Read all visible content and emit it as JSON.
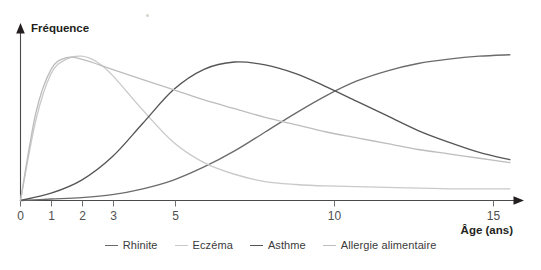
{
  "chart_data": {
    "type": "line",
    "title": "",
    "xlabel": "Âge (ans)",
    "ylabel": "Fréquence",
    "grid": false,
    "legend_position": "bottom-center",
    "xlim": [
      0,
      16.2
    ],
    "ylim": [
      0,
      1.06
    ],
    "xticks": [
      0,
      1,
      2,
      3,
      5,
      10,
      15
    ],
    "xtick_labels": [
      "0",
      "1",
      "2",
      "3",
      "5",
      "10",
      "15"
    ],
    "yticks": [],
    "ytick_labels": [],
    "series": [
      {
        "name": "Rhinite",
        "color": "#6b6b6b",
        "x": [
          0,
          1,
          2,
          3,
          4,
          5,
          6,
          7,
          8,
          9,
          10,
          11,
          12,
          13,
          14,
          15,
          16
        ],
        "values": [
          0.0,
          0.01,
          0.02,
          0.04,
          0.08,
          0.14,
          0.23,
          0.34,
          0.47,
          0.6,
          0.72,
          0.82,
          0.89,
          0.94,
          0.97,
          0.99,
          1.0
        ]
      },
      {
        "name": "Eczéma",
        "color": "#c9c9c9",
        "x": [
          0,
          0.5,
          1,
          1.5,
          2,
          2.5,
          3,
          4,
          5,
          6,
          7,
          8,
          9,
          10,
          12,
          14,
          16
        ],
        "values": [
          0.0,
          0.55,
          0.87,
          0.97,
          0.99,
          0.95,
          0.86,
          0.62,
          0.4,
          0.26,
          0.18,
          0.13,
          0.11,
          0.1,
          0.09,
          0.08,
          0.08
        ]
      },
      {
        "name": "Asthme",
        "color": "#555555",
        "x": [
          0,
          1,
          2,
          3,
          4,
          5,
          6,
          7,
          8,
          9,
          10,
          11,
          12,
          13,
          14,
          15,
          16
        ],
        "values": [
          0.0,
          0.05,
          0.14,
          0.3,
          0.53,
          0.76,
          0.9,
          0.95,
          0.93,
          0.87,
          0.78,
          0.68,
          0.58,
          0.48,
          0.4,
          0.33,
          0.28
        ]
      },
      {
        "name": "Allergie alimentaire",
        "color": "#bdbdbd",
        "x": [
          0,
          0.5,
          1,
          1.5,
          2,
          3,
          4,
          5,
          6,
          7,
          8,
          9,
          10,
          11,
          12,
          13,
          14,
          15,
          16
        ],
        "values": [
          0.0,
          0.6,
          0.9,
          0.98,
          0.97,
          0.9,
          0.83,
          0.76,
          0.69,
          0.63,
          0.57,
          0.52,
          0.47,
          0.43,
          0.39,
          0.35,
          0.32,
          0.29,
          0.26
        ]
      }
    ]
  },
  "axes": {
    "y_label": "Fréquence",
    "x_label": "Âge (ans)",
    "x_tick_labels": [
      "0",
      "1",
      "2",
      "3",
      "5",
      "10",
      "15"
    ]
  },
  "legend": {
    "items": [
      {
        "label": "Rhinite",
        "color": "#6b6b6b"
      },
      {
        "label": "Eczéma",
        "color": "#c9c9c9"
      },
      {
        "label": "Asthme",
        "color": "#555555"
      },
      {
        "label": "Allergie alimentaire",
        "color": "#bdbdbd"
      }
    ]
  }
}
